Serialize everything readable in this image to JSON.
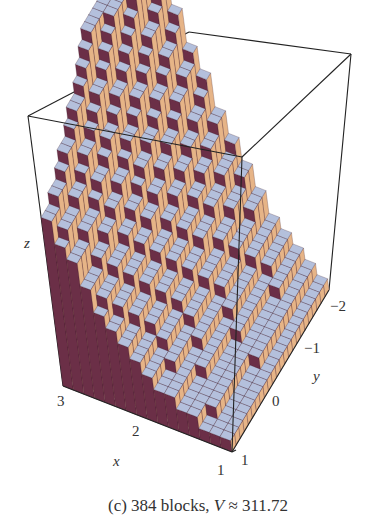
{
  "chart_data": {
    "type": "3d-bar",
    "title": "",
    "caption": {
      "prefix": "(c) 384 blocks, ",
      "var": "V",
      "suffix": " ≈ 311.72"
    },
    "block_count": 384,
    "volume": 311.72,
    "axes": {
      "x": {
        "label": "x",
        "ticks": [
          "3",
          "2",
          "1"
        ],
        "range": [
          1,
          3
        ]
      },
      "y": {
        "label": "y",
        "ticks": [
          "1",
          "0",
          "−1",
          "−2"
        ],
        "range": [
          -2,
          1
        ]
      },
      "z": {
        "label": "z"
      }
    },
    "grid": {
      "nx": 16,
      "ny": 24
    },
    "colors": {
      "top_face": "#b4c0dc",
      "front_face": "#6b2f47",
      "side_face": "#e6b487",
      "wall_face": "#5c1b30",
      "box_edge": "#222222"
    }
  }
}
